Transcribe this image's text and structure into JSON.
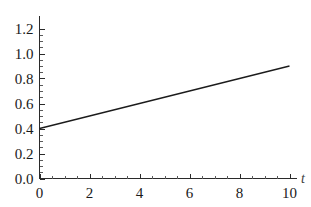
{
  "chart_data": {
    "type": "line",
    "title": "",
    "subtitle": "",
    "xlabel": "t",
    "ylabel": "",
    "xlim": [
      0,
      10
    ],
    "ylim": [
      0,
      1.2
    ],
    "grid": false,
    "legend": false,
    "legend_position": "none",
    "x_ticks": [
      0,
      2,
      4,
      6,
      8,
      10
    ],
    "x_tick_labels": [
      "0",
      "2",
      "4",
      "6",
      "8",
      "10"
    ],
    "x_minor_tick_step": 0.5,
    "y_ticks": [
      0.0,
      0.2,
      0.4,
      0.6,
      0.8,
      1.0,
      1.2
    ],
    "y_tick_labels": [
      "0.0",
      "0.2",
      "0.4",
      "0.6",
      "0.8",
      "1.0",
      "1.2"
    ],
    "y_minor_tick_step": 0.05,
    "series": [
      {
        "name": "line",
        "color": "#1c1c1c",
        "x": [
          0,
          1,
          2,
          3,
          4,
          5,
          6,
          7,
          8,
          9,
          10
        ],
        "values": [
          0.4,
          0.45,
          0.5,
          0.55,
          0.6,
          0.65,
          0.7,
          0.75,
          0.8,
          0.85,
          0.9
        ],
        "slope": 0.05,
        "intercept": 0.4
      }
    ],
    "annotations": []
  },
  "axes": {
    "x_axis_name": "t",
    "y_axis_name": ""
  },
  "colors": {
    "background": "#ffffff",
    "line": "#1c1c1c",
    "axis": "#2a2a2a",
    "text": "#1a1a1a"
  }
}
